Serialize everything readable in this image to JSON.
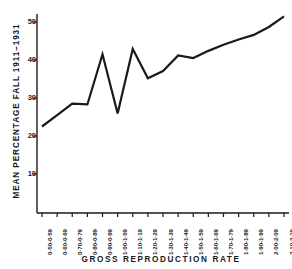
{
  "chart_data": {
    "type": "line",
    "title": "",
    "xlabel": "GROSS   REPRODUCTION   RATE",
    "ylabel": "MEAN  PERCENTAGE  FALL   1911–1931",
    "grid": false,
    "legend": false,
    "ylim": [
      0,
      55
    ],
    "yticks": [
      10,
      20,
      30,
      40,
      50
    ],
    "ytick_labels": [
      "10",
      "20",
      "30",
      "40",
      "50"
    ],
    "categories": [
      "0·50-0·59",
      "0·60-0·69",
      "0·70-0·79",
      "0·80-0·89",
      "0·90-0·99",
      "1·00-1·09",
      "1·10-1·19",
      "1·20-1·29",
      "1·30-1·39",
      "1·40-1·49",
      "1·50-1·59",
      "1·60-1·69",
      "1·70-1·79",
      "1·80-1·89",
      "1·90-1·99",
      "2·00-2·09",
      "2·10-2·19"
    ],
    "values": [
      22.5,
      25.5,
      28.5,
      28.3,
      41.5,
      25.9,
      42.9,
      35.2,
      37.1,
      41.2,
      40.5,
      42.4,
      44.0,
      45.4,
      46.6,
      48.7,
      51.5
    ],
    "series": [
      {
        "name": "Mean percentage fall",
        "values": [
          22.5,
          25.5,
          28.5,
          28.3,
          41.5,
          25.9,
          42.9,
          35.2,
          37.1,
          41.2,
          40.5,
          42.4,
          44.0,
          45.4,
          46.6,
          48.7,
          51.5
        ]
      }
    ],
    "line_color": "#1a1a1a",
    "axis_color": "#1a1a1a"
  }
}
